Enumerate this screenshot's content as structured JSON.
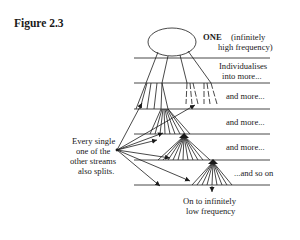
{
  "figure": {
    "title": "Figure 2.3"
  },
  "labels": {
    "one_bold": "ONE",
    "one_paren_line1": "(infinitely",
    "one_paren_line2": "high frequency)",
    "level1_line1": "Individualises",
    "level1_line2": "into more...",
    "level2": "and more...",
    "level3": "and more...",
    "level4": "and more...",
    "level5": "...and so on",
    "bottom_line1": "On to infinitely",
    "bottom_line2": "low frequency",
    "side_line1": "Every single",
    "side_line2": "one of the",
    "side_line3": "other streams",
    "side_line4": "also splits."
  },
  "colors": {
    "ink": "#1a1a1a",
    "background": "#ffffff"
  }
}
